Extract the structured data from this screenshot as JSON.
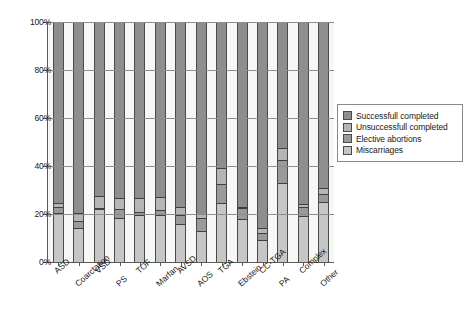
{
  "chart_data": {
    "type": "bar",
    "stacked": true,
    "title": "",
    "subtitle": "",
    "xlabel": "",
    "ylabel": "",
    "ylim": [
      0,
      100
    ],
    "ytick_labels": [
      "0%",
      "20%",
      "40%",
      "60%",
      "80%",
      "100%"
    ],
    "ytick_values": [
      0,
      20,
      40,
      60,
      80,
      100
    ],
    "grid": true,
    "legend_position": "right",
    "categories": [
      "ASD",
      "Coarctation",
      "VSD",
      "PS",
      "TOF",
      "Marfan",
      "AVSD",
      "AOS",
      "TGA",
      "Ebstein",
      "CC-TGA",
      "PA",
      "Complex",
      "Other"
    ],
    "series": [
      {
        "name": "Miscarriages",
        "color": "#c6c6c6",
        "values": [
          20.5,
          14.0,
          22.0,
          18.5,
          19.5,
          19.5,
          16.0,
          13.0,
          24.5,
          18.0,
          9.0,
          33.0,
          19.0,
          25.0
        ]
      },
      {
        "name": "Elective abortions",
        "color": "#9a9a9a",
        "values": [
          2.5,
          3.0,
          0.5,
          3.5,
          1.5,
          2.0,
          3.5,
          5.5,
          8.0,
          4.5,
          3.0,
          9.5,
          4.0,
          3.5
        ]
      },
      {
        "name": "Unsuccessfull completed",
        "color": "#b5b5b5",
        "values": [
          1.5,
          3.5,
          5.0,
          4.5,
          5.5,
          5.5,
          3.5,
          1.5,
          6.5,
          0.5,
          2.0,
          5.0,
          1.0,
          2.5
        ]
      },
      {
        "name": "Successfull completed",
        "color": "#8e8e8e",
        "values": [
          75.5,
          79.5,
          72.5,
          73.5,
          73.5,
          73.0,
          77.0,
          80.0,
          61.0,
          77.0,
          86.0,
          52.5,
          76.0,
          69.0
        ]
      }
    ]
  },
  "legend": {
    "entries": [
      {
        "label": "Successfull completed",
        "color": "#8e8e8e"
      },
      {
        "label": "Unsuccessfull completed",
        "color": "#b5b5b5"
      },
      {
        "label": "Elective abortions",
        "color": "#9a9a9a"
      },
      {
        "label": "Miscarriages",
        "color": "#c6c6c6"
      }
    ]
  }
}
